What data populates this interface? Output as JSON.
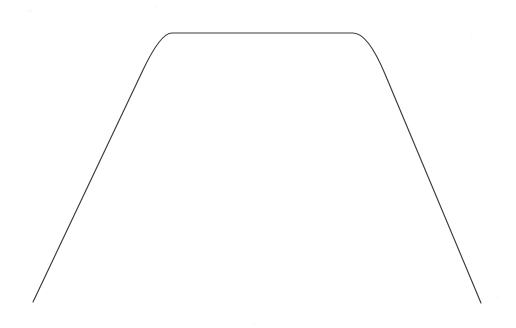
{
  "figure": {
    "background_color": "#ffffff",
    "stroke_color": "#3a3a3c",
    "stroke_width": 1.15,
    "width": 516,
    "height": 328,
    "caption": ""
  },
  "chart_data": {
    "type": "line",
    "title": "",
    "subtitle": "",
    "xlabel": "",
    "ylabel": "",
    "xlim": [
      0,
      516
    ],
    "ylim": [
      328,
      0
    ],
    "grid": false,
    "legend": null,
    "axes_visible": false,
    "tick_labels": {
      "x": [],
      "y": []
    },
    "annotations": [],
    "series": [
      {
        "name": "plateau-curve",
        "color": "#3a3a3c",
        "linewidth": 1.15,
        "marker": "none",
        "closed": false,
        "x": [
          33,
          45,
          58,
          67,
          80,
          95,
          110,
          125,
          136,
          143,
          150,
          158,
          166,
          172,
          200,
          240,
          280,
          320,
          345,
          353,
          360,
          368,
          376,
          383,
          390,
          400,
          412,
          425,
          437,
          449,
          462,
          472,
          481
        ],
        "y": [
          302,
          290,
          276,
          265,
          251,
          234,
          216,
          198,
          184,
          173,
          160,
          144,
          126,
          112,
          104,
          100,
          98,
          98,
          100,
          103,
          108,
          116,
          128,
          142,
          160,
          178,
          196,
          214,
          232,
          250,
          268,
          286,
          303
        ],
        "path_segments": [
          {
            "kind": "line",
            "from": [
              33,
              302
            ],
            "to": [
              143,
              70
            ],
            "note": "left slanted leg rising to left shoulder"
          },
          {
            "kind": "arc",
            "from": [
              143,
              70
            ],
            "to": [
              172,
              33
            ],
            "note": "left rounded shoulder"
          },
          {
            "kind": "line",
            "from": [
              172,
              33
            ],
            "to": [
              353,
              33
            ],
            "note": "flat plateau top"
          },
          {
            "kind": "arc",
            "from": [
              353,
              33
            ],
            "to": [
              385,
              74
            ],
            "note": "right rounded shoulder"
          },
          {
            "kind": "line",
            "from": [
              385,
              74
            ],
            "to": [
              481,
              303
            ],
            "note": "right slanted leg descending"
          }
        ],
        "endpoints": {
          "left": [
            33,
            302
          ],
          "right": [
            481,
            303
          ]
        },
        "plateau": {
          "y": 33,
          "x_start": 172,
          "x_end": 353
        }
      }
    ]
  },
  "artifacts": {
    "specks": [
      {
        "x": 28,
        "y": 9,
        "size": 4
      },
      {
        "x": 155,
        "y": 5,
        "size": 3
      },
      {
        "x": 470,
        "y": 33,
        "size": 3
      },
      {
        "x": 252,
        "y": 322,
        "size": 3
      },
      {
        "x": 497,
        "y": 296,
        "size": 3
      }
    ]
  }
}
